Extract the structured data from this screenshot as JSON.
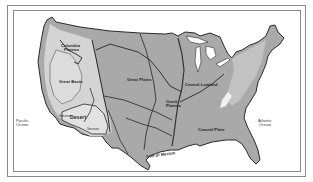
{
  "map": {
    "title": "Physiographic regions of the United States",
    "colors": {
      "land": "#a9a9a9",
      "land_light": "#d4d4d4",
      "land_mid": "#bdbdbd",
      "border": "#2a2a2a",
      "rivers": "#3a3a3a",
      "water": "#ffffff",
      "frame": "#8a8a8a"
    },
    "regions": [
      {
        "id": "columbia-plateau",
        "label_line1": "Columbia",
        "label_line2": "Plateau"
      },
      {
        "id": "great-basin",
        "label": "Great Basin"
      },
      {
        "id": "great-plains",
        "label": "Great Plains"
      },
      {
        "id": "central-lowland",
        "label": "Central Lowland"
      },
      {
        "id": "ozark-plateau",
        "label_line1": "Ozark",
        "label_line2": "Plateau"
      },
      {
        "id": "desert",
        "label": "Desert"
      },
      {
        "id": "sonoran-1",
        "label": "Sonoran"
      },
      {
        "id": "sonoran-2",
        "label": "Sonoran"
      },
      {
        "id": "coastal-plain",
        "label": "Coastal Plain"
      }
    ],
    "water_bodies": [
      {
        "id": "pacific-ocean",
        "label_line1": "Pacific",
        "label_line2": "Ocean"
      },
      {
        "id": "atlantic-ocean",
        "label_line1": "Atlantic",
        "label_line2": "Ocean"
      },
      {
        "id": "gulf-of-mexico",
        "label": "Gulf of Mexico"
      }
    ]
  }
}
